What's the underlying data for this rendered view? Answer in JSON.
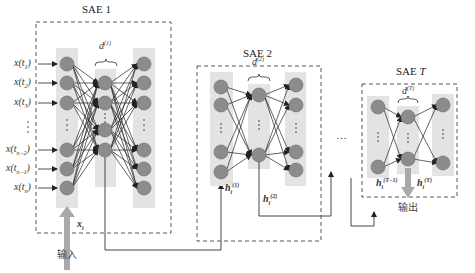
{
  "diagram": {
    "blocks": [
      {
        "id": "sae1",
        "title": "SAE 1",
        "hidden_dim_label": "d",
        "hidden_dim_sup": "(1)"
      },
      {
        "id": "sae2",
        "title": "SAE 2",
        "hidden_dim_label": "d",
        "hidden_dim_sup": "(2)"
      },
      {
        "id": "saeT",
        "title_prefix": "SAE ",
        "title_italic": "T",
        "hidden_dim_label": "d",
        "hidden_dim_sup": "(T)"
      }
    ],
    "inputs": [
      {
        "base": "x(t",
        "sub": "1",
        "close": ")"
      },
      {
        "base": "x(t",
        "sub": "2",
        "close": ")"
      },
      {
        "base": "x(t",
        "sub": "3",
        "close": ")"
      },
      {
        "base": "⋮",
        "sub": "",
        "close": ""
      },
      {
        "base": "x(t",
        "sub": "n−2",
        "close": ")"
      },
      {
        "base": "x(t",
        "sub": "n−1",
        "close": ")"
      },
      {
        "base": "x(t",
        "sub": "n",
        "close": ")"
      }
    ],
    "input_vector": {
      "base": "x",
      "sub": "i"
    },
    "hidden_reps": [
      {
        "base": "h",
        "sub": "i",
        "sup": "(1)"
      },
      {
        "base": "h",
        "sub": "i",
        "sup": "(2)"
      },
      {
        "base": "h",
        "sub": "i",
        "sup": "(T−1)"
      },
      {
        "base": "h",
        "sub": "i",
        "sup": "(T)"
      }
    ],
    "ellipsis_between": "…",
    "input_caption": "输入",
    "output_caption": "输出",
    "colors": {
      "node_fill": "#8c8c8c",
      "node_stroke": "#555555",
      "column_fill": "#e3e3e3",
      "big_arrow": "#a9a9a9",
      "line": "#333333",
      "dashed_box": "#555555"
    }
  }
}
